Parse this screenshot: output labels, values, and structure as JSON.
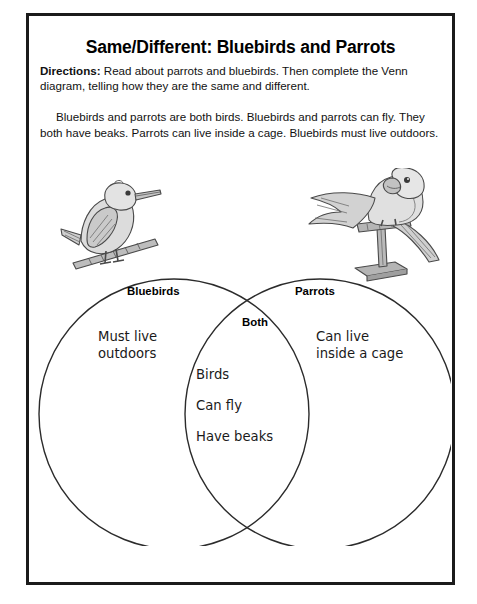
{
  "worksheet": {
    "title": "Same/Different: Bluebirds and Parrots",
    "directions_label": "Directions:",
    "directions_text": " Read about parrots and bluebirds. Then complete the Venn diagram, telling how they are the same and different.",
    "passage": "Bluebirds and parrots are both birds. Bluebirds and parrots can fly. They both have beaks. Parrots can live inside a cage. Bluebirds must live outdoors."
  },
  "illustrations": [
    {
      "name": "bluebird-illustration",
      "alt": "bluebird perched on a branch"
    },
    {
      "name": "parrot-illustration",
      "alt": "parrot with spread wings on a perch stand"
    }
  ],
  "venn": {
    "left_label": "Bluebirds",
    "both_label": "Both",
    "right_label": "Parrots",
    "left_entries": [
      "Must live",
      "outdoors"
    ],
    "both_entries": [
      "Birds",
      "Can fly",
      "Have beaks"
    ],
    "right_entries": [
      "Can live",
      "inside a cage"
    ]
  },
  "colors": {
    "page_background": "#ffffff",
    "border": "#1b1b1b",
    "text": "#111111",
    "venn_stroke": "#2b2b2b",
    "art_fill": "#d8d8d8",
    "art_stroke": "#4a4a4a"
  }
}
